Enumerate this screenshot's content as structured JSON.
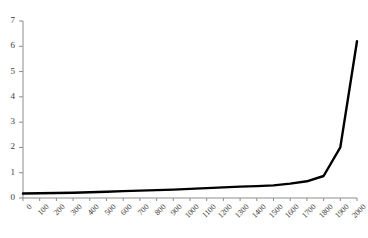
{
  "chart_data": {
    "type": "line",
    "title": "",
    "subtitle": "",
    "xlabel": "",
    "ylabel": "",
    "xlim": [
      0,
      2000
    ],
    "ylim": [
      0,
      7
    ],
    "grid": false,
    "legend": null,
    "legend_position": "none",
    "line_color": "#000000",
    "axis_color": "#808080",
    "x_tick_rotation": -45,
    "x": [
      0,
      100,
      200,
      300,
      400,
      500,
      600,
      700,
      800,
      900,
      1000,
      1100,
      1200,
      1300,
      1400,
      1500,
      1600,
      1700,
      1800,
      1900,
      2000
    ],
    "xtick_labels": [
      "0",
      "100",
      "200",
      "300",
      "400",
      "500",
      "600",
      "700",
      "800",
      "900",
      "1000",
      "1100",
      "1200",
      "1300",
      "1400",
      "1500",
      "1600",
      "1700",
      "1800",
      "1900",
      "2000"
    ],
    "ytick_labels": [
      "0",
      "1",
      "2",
      "3",
      "4",
      "5",
      "6",
      "7"
    ],
    "yticks": [
      0,
      1,
      2,
      3,
      4,
      5,
      6,
      7
    ],
    "series": [
      {
        "name": "series-1",
        "values": [
          0.18,
          0.19,
          0.2,
          0.21,
          0.23,
          0.25,
          0.27,
          0.29,
          0.31,
          0.33,
          0.36,
          0.39,
          0.42,
          0.45,
          0.47,
          0.5,
          0.57,
          0.66,
          0.87,
          2.0,
          6.2
        ]
      }
    ]
  }
}
